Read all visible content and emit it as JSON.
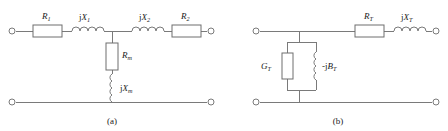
{
  "figure": {
    "subfigures": [
      {
        "id": "a",
        "caption": "(a)",
        "caption_x": 112,
        "caption_y": 124,
        "description": "Full T equivalent circuit with series primary and secondary impedances and a shunt magnetizing branch",
        "terminals": [
          {
            "name": "terminal-top-left",
            "x": 12,
            "y": 31
          },
          {
            "name": "terminal-top-right",
            "x": 211,
            "y": 31
          },
          {
            "name": "terminal-bottom-left",
            "x": 12,
            "y": 102
          },
          {
            "name": "terminal-bottom-right",
            "x": 211,
            "y": 102
          }
        ],
        "elements": [
          {
            "name": "resistor-r1",
            "type": "resistor",
            "orientation": "horizontal",
            "label": "R",
            "subscript": "1",
            "prefix": "",
            "box_x": 33,
            "box_y": 25,
            "box_w": 29,
            "box_h": 12,
            "label_x": 42,
            "label_y": 19
          },
          {
            "name": "inductor-jx1",
            "type": "inductor",
            "orientation": "horizontal",
            "label": "X",
            "subscript": "1",
            "prefix": "j",
            "coil_x": 72,
            "coil_y": 31,
            "coil_len": 32,
            "turns": 4,
            "label_x": 79,
            "label_y": 20
          },
          {
            "name": "inductor-jx2",
            "type": "inductor",
            "orientation": "horizontal",
            "label": "X",
            "subscript": "2",
            "prefix": "j",
            "coil_x": 132,
            "coil_y": 31,
            "coil_len": 32,
            "turns": 4,
            "label_x": 139,
            "label_y": 20
          },
          {
            "name": "resistor-r2",
            "type": "resistor",
            "orientation": "horizontal",
            "label": "R",
            "subscript": "2",
            "prefix": "",
            "box_x": 172,
            "box_y": 25,
            "box_w": 29,
            "box_h": 12,
            "label_x": 181,
            "label_y": 19
          },
          {
            "name": "resistor-rm",
            "type": "resistor",
            "orientation": "vertical",
            "label": "R",
            "subscript": "m",
            "prefix": "",
            "box_x": 106,
            "box_y": 43,
            "box_w": 12,
            "box_h": 27,
            "label_x": 122,
            "label_y": 58
          },
          {
            "name": "inductor-jxm",
            "type": "inductor",
            "orientation": "vertical",
            "label": "X",
            "subscript": "m",
            "prefix": "j",
            "coil_x": 112,
            "coil_y": 74,
            "coil_len": 28,
            "turns": 4,
            "label_x": 120,
            "label_y": 91
          }
        ]
      },
      {
        "id": "b",
        "caption": "(b)",
        "caption_x": 338,
        "caption_y": 124,
        "description": "Simplified equivalent circuit with total series impedance and a shunt admittance branch",
        "terminals": [
          {
            "name": "terminal-top-left",
            "x": 256,
            "y": 31
          },
          {
            "name": "terminal-top-right",
            "x": 436,
            "y": 31
          },
          {
            "name": "terminal-bottom-left",
            "x": 256,
            "y": 102
          },
          {
            "name": "terminal-bottom-right",
            "x": 436,
            "y": 102
          }
        ],
        "elements": [
          {
            "name": "resistor-rt",
            "type": "resistor",
            "orientation": "horizontal",
            "label": "R",
            "subscript": "T",
            "prefix": "",
            "box_x": 355,
            "box_y": 25,
            "box_w": 29,
            "box_h": 12,
            "label_x": 364,
            "label_y": 19
          },
          {
            "name": "inductor-jxt",
            "type": "inductor",
            "orientation": "horizontal",
            "label": "X",
            "subscript": "T",
            "prefix": "j",
            "coil_x": 394,
            "coil_y": 31,
            "coil_len": 32,
            "turns": 4,
            "label_x": 401,
            "label_y": 20
          },
          {
            "name": "conductance-gt",
            "type": "resistor",
            "orientation": "vertical",
            "label": "G",
            "subscript": "T",
            "prefix": "",
            "box_x": 282,
            "box_y": 53,
            "box_w": 11,
            "box_h": 26,
            "label_x": 271,
            "label_y": 69
          },
          {
            "name": "susceptance-jbt",
            "type": "inductor",
            "orientation": "vertical",
            "label": "B",
            "subscript": "T",
            "prefix": "-j",
            "coil_x": 316,
            "coil_y": 52,
            "coil_len": 28,
            "turns": 4,
            "label_x": 322,
            "label_y": 69
          }
        ]
      }
    ],
    "colors": {
      "wire": "#7a7a7a",
      "box_stroke": "#6e6e6e",
      "box_fill": "#ffffff",
      "text": "#1a1a1a",
      "background": "#ffffff"
    }
  }
}
